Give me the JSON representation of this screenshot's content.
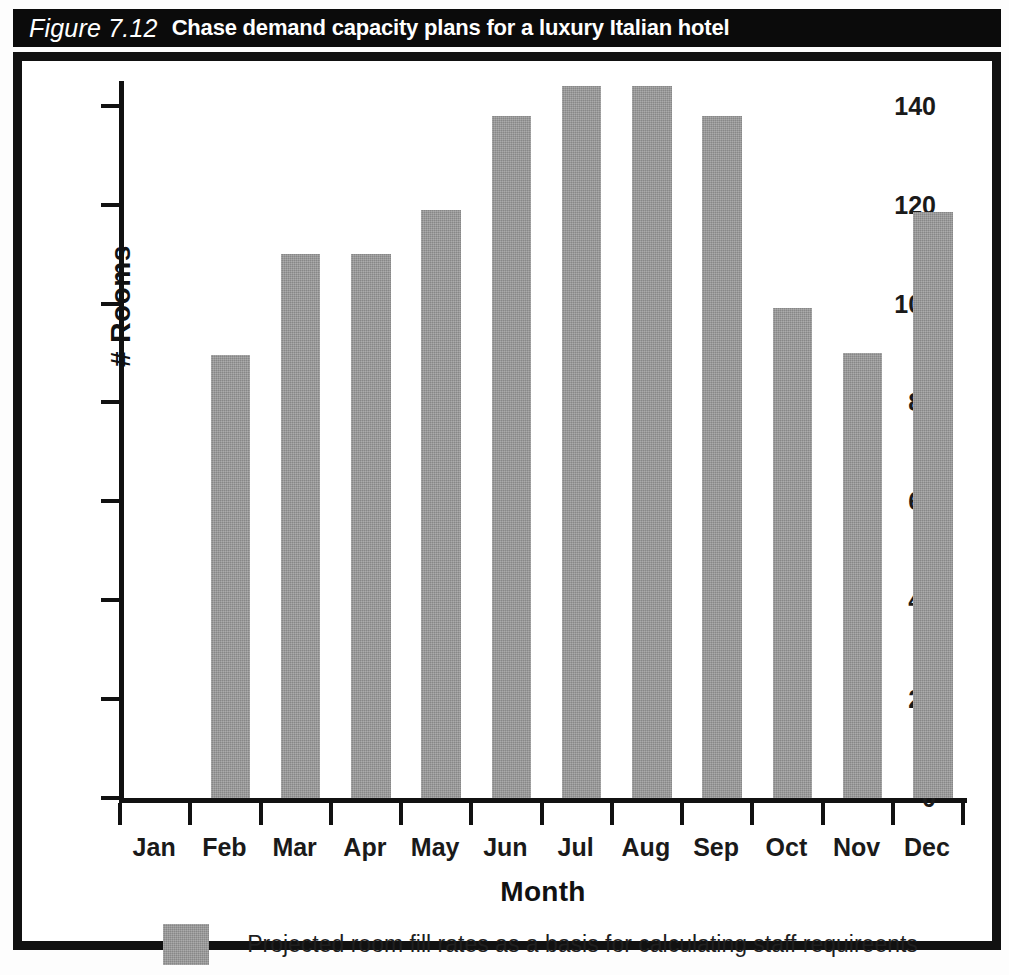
{
  "figure": {
    "number_label": "Figure 7.12",
    "title": "Chase demand capacity plans for a luxury Italian hotel"
  },
  "chart_data": {
    "type": "bar",
    "title": "Chase demand capacity plans for a luxury Italian hotel",
    "xlabel": "Month",
    "ylabel": "# Rooms",
    "ylim": [
      0,
      145
    ],
    "ytick_values": [
      0,
      20,
      40,
      60,
      80,
      100,
      120,
      140
    ],
    "ytick_labels": [
      "0",
      "20",
      "40",
      "60",
      "80",
      "100",
      "120",
      "140"
    ],
    "grid": false,
    "legend_position": "bottom-center",
    "bar_color": "#969696",
    "categories": [
      "Jan",
      "Feb",
      "Mar",
      "Apr",
      "May",
      "Jun",
      "Jul",
      "Aug",
      "Sep",
      "Oct",
      "Nov",
      "Dec"
    ],
    "values": [
      0,
      89.5,
      110,
      110,
      119,
      138,
      144,
      144,
      138,
      99,
      90,
      118.5
    ],
    "series": [
      {
        "name": "Projected room fill rates as a basis for calculating staff requireents",
        "values": [
          0,
          89.5,
          110,
          110,
          119,
          138,
          144,
          144,
          138,
          99,
          90,
          118.5
        ]
      }
    ],
    "legend": [
      {
        "label": "Projected room fill rates as a basis for calculating staff requireents",
        "color": "#969696"
      }
    ]
  }
}
